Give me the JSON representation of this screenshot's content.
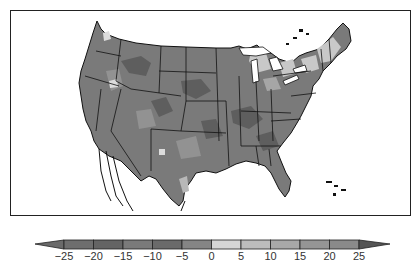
{
  "map": {
    "region": "Contiguous United States",
    "style": "grayscale filled contour map with state boundaries",
    "colors": {
      "land_base": "#7a7a7a",
      "land_dark": "#5e5e5e",
      "land_light": "#c8c8c8",
      "land_mid_light": "#a6a6a6",
      "border": "#111111",
      "ocean": "#ffffff"
    }
  },
  "colorbar": {
    "orientation": "horizontal",
    "extend": "both",
    "ticks": [
      "−25",
      "−20",
      "−15",
      "−10",
      "−5",
      "0",
      "5",
      "10",
      "15",
      "20",
      "25"
    ],
    "segments": [
      {
        "from": -25,
        "to": -20,
        "color": "#6e6e6e"
      },
      {
        "from": -20,
        "to": -15,
        "color": "#646464"
      },
      {
        "from": -15,
        "to": -10,
        "color": "#7a7a7a"
      },
      {
        "from": -10,
        "to": -5,
        "color": "#6a6a6a"
      },
      {
        "from": -5,
        "to": 0,
        "color": "#858585"
      },
      {
        "from": 0,
        "to": 5,
        "color": "#d6d6d6"
      },
      {
        "from": 5,
        "to": 10,
        "color": "#bdbdbd"
      },
      {
        "from": 10,
        "to": 15,
        "color": "#a8a8a8"
      },
      {
        "from": 15,
        "to": 20,
        "color": "#959595"
      },
      {
        "from": 20,
        "to": 25,
        "color": "#8a8a8a"
      }
    ],
    "under_color": "#6a6a6a",
    "over_color": "#555555"
  }
}
